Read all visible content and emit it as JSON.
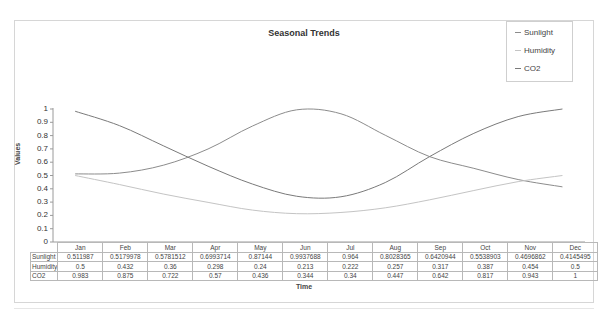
{
  "chart_data": {
    "type": "line",
    "title": "Seasonal Trends",
    "xlabel": "Time",
    "ylabel": "Values",
    "ylim": [
      0,
      1
    ],
    "yticks": [
      "0",
      "0.1",
      "0.2",
      "0.3",
      "0.4",
      "0.5",
      "0.6",
      "0.7",
      "0.8",
      "0.9",
      "1"
    ],
    "grid": false,
    "legend_position": "top-right",
    "categories": [
      "Jan",
      "Feb",
      "Mar",
      "Apr",
      "May",
      "Jun",
      "Jul",
      "Aug",
      "Sep",
      "Oct",
      "Nov",
      "Dec"
    ],
    "series": [
      {
        "name": "Sunlight",
        "color": "#8c8c8c",
        "values": [
          0.511987,
          0.5179978,
          0.5781512,
          0.6993714,
          0.87144,
          0.9937688,
          0.964,
          0.8028365,
          0.6420944,
          0.5538903,
          0.4696862,
          0.4145495
        ],
        "display": [
          "0.511987",
          "0.5179978",
          "0.5781512",
          "0.6993714",
          "0.87144",
          "0.9937688",
          "0.964",
          "0.8028365",
          "0.6420944",
          "0.5538903",
          "0.4696862",
          "0.4145495"
        ]
      },
      {
        "name": "Humidity",
        "color": "#c4c4c4",
        "values": [
          0.5,
          0.432,
          0.36,
          0.298,
          0.24,
          0.213,
          0.222,
          0.257,
          0.317,
          0.387,
          0.454,
          0.5
        ],
        "display": [
          "0.5",
          "0.432",
          "0.36",
          "0.298",
          "0.24",
          "0.213",
          "0.222",
          "0.257",
          "0.317",
          "0.387",
          "0.454",
          "0.5"
        ]
      },
      {
        "name": "CO2",
        "color": "#7a7a7a",
        "values": [
          0.983,
          0.875,
          0.722,
          0.57,
          0.436,
          0.344,
          0.34,
          0.447,
          0.642,
          0.817,
          0.943,
          1
        ],
        "display": [
          "0.983",
          "0.875",
          "0.722",
          "0.57",
          "0.436",
          "0.344",
          "0.34",
          "0.447",
          "0.642",
          "0.817",
          "0.943",
          "1"
        ]
      }
    ]
  },
  "legend": {
    "items": [
      {
        "label": "Sunlight",
        "color": "#8c8c8c"
      },
      {
        "label": "Humidity",
        "color": "#c4c4c4"
      },
      {
        "label": "CO2",
        "color": "#7a7a7a"
      }
    ]
  }
}
